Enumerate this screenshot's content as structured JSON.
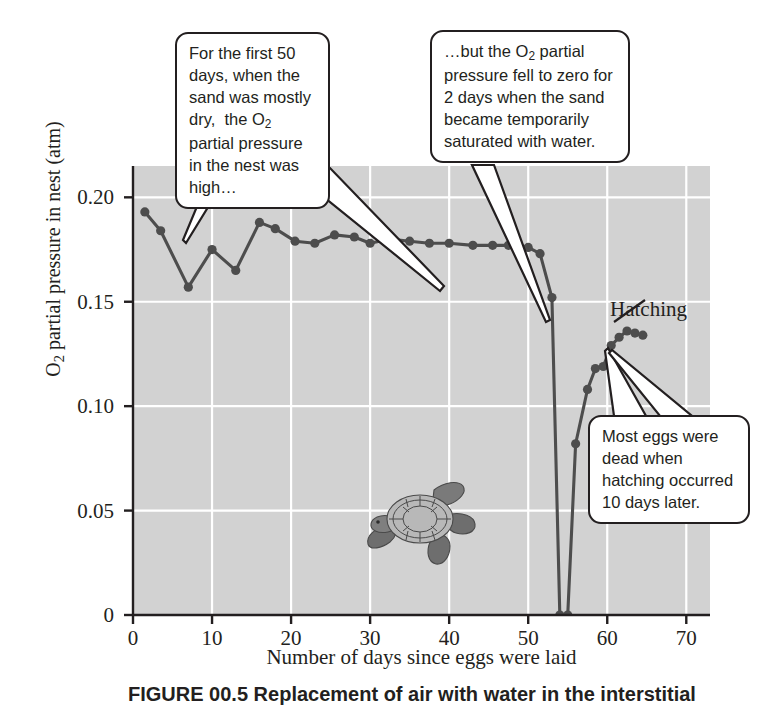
{
  "figure": {
    "caption": "FIGURE 00.5  Replacement of air with water in the interstitial",
    "illustration_name": "sea-turtle"
  },
  "annotations": {
    "callout_dry": "For the first 50 days, when the sand was mostly dry,  the O2 partial pressure in the nest was high…",
    "callout_zero": "…but the O2 partial pressure fell to zero for 2 days when the sand became temporarily saturated with water.",
    "callout_dead": "Most eggs were dead when hatching occurred 10 days later.",
    "hatching_label": "Hatching"
  },
  "chart_data": {
    "type": "line",
    "title": "",
    "xlabel": "Number of days since eggs were laid",
    "ylabel": "O2 partial pressure in nest (atm)",
    "xlim": [
      0,
      73
    ],
    "ylim": [
      0,
      0.215
    ],
    "xticks": [
      0,
      10,
      20,
      30,
      40,
      50,
      60,
      70
    ],
    "xtick_labels": [
      "0",
      "10",
      "20",
      "30",
      "40",
      "50",
      "60",
      "70"
    ],
    "yticks": [
      0,
      0.05,
      0.1,
      0.15,
      0.2
    ],
    "ytick_labels": [
      "0",
      "0.05",
      "0.10",
      "0.15",
      "0.20"
    ],
    "grid": true,
    "grid_color": "#ffffff",
    "panel_color": "#d2d2d2",
    "line_color": "#4d4d4d",
    "marker_color": "#4d4d4d",
    "marker": "circle",
    "legend": "none",
    "series": [
      {
        "name": "O2 partial pressure in nest",
        "x": [
          1.5,
          3.5,
          7.0,
          10.0,
          13.0,
          16.0,
          18.0,
          20.5,
          23.0,
          25.5,
          28.0,
          30.0,
          32.5,
          35.0,
          37.5,
          40.0,
          43.0,
          45.5,
          47.5,
          48.8,
          50.0,
          51.5,
          53.0,
          54.0,
          55.0,
          56.0,
          57.5,
          58.5,
          59.5,
          60.5,
          61.5,
          62.5,
          63.5,
          64.5
        ],
        "y": [
          0.193,
          0.184,
          0.157,
          0.175,
          0.165,
          0.188,
          0.185,
          0.179,
          0.178,
          0.182,
          0.181,
          0.178,
          0.18,
          0.179,
          0.178,
          0.178,
          0.177,
          0.177,
          0.177,
          0.177,
          0.176,
          0.173,
          0.152,
          0.0,
          0.0,
          0.082,
          0.108,
          0.118,
          0.119,
          0.129,
          0.133,
          0.136,
          0.135,
          0.134
        ]
      }
    ],
    "annotation_points": {
      "zero_days": [
        54,
        55
      ],
      "plateau_note": "first 50 days high ~0.18 atm",
      "hatching_day": 64.5
    }
  },
  "colors": {
    "panel": "#d2d2d2",
    "grid": "#ffffff",
    "ink": "#231f20",
    "data": "#4d4d4d"
  }
}
